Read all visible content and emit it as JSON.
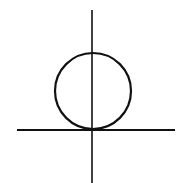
{
  "diagram": {
    "stroke_color": "#111111",
    "background": "#ffffff",
    "vertical_axis": {
      "x": 92,
      "y1": 10,
      "y2": 183
    },
    "horizontal_axis": {
      "y": 130,
      "x1": 17,
      "x2": 175
    },
    "circle": {
      "cx": 93,
      "cy": 91,
      "r": 38
    }
  }
}
